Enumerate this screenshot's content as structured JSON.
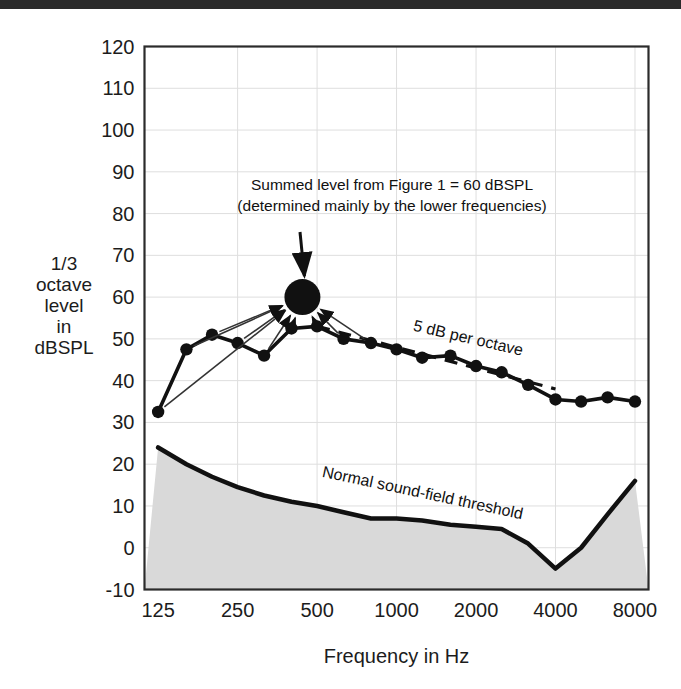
{
  "figure": {
    "background_color": "#ffffff",
    "top_rule_color": "#2b2b2b",
    "ylabel_lines": [
      "1/3",
      "octave",
      "level",
      "in",
      "dBSPL"
    ],
    "xlabel": "Frequency in Hz"
  },
  "chart_data": {
    "type": "line",
    "title": "",
    "xlabel": "Frequency in Hz",
    "ylabel": "1/3 octave level in dBSPL",
    "x_scale": "log",
    "xlim": [
      111,
      9000
    ],
    "ylim": [
      -10,
      120
    ],
    "ytick_labels": [
      "120",
      "110",
      "100",
      "90",
      "80",
      "70",
      "60",
      "50",
      "40",
      "30",
      "20",
      "10",
      "0",
      "-10"
    ],
    "yticks": [
      120,
      110,
      100,
      90,
      80,
      70,
      60,
      50,
      40,
      30,
      20,
      10,
      0,
      -10
    ],
    "xtick_labels": [
      "125",
      "250",
      "500",
      "1000",
      "2000",
      "4000",
      "8000"
    ],
    "xticks": [
      125,
      250,
      500,
      1000,
      2000,
      4000,
      8000
    ],
    "grid": true,
    "legend_position": "none",
    "series": [
      {
        "name": "1/3 octave band levels",
        "style": "line-markers",
        "color": "#111111",
        "marker": "filled-circle",
        "x": [
          125,
          160,
          200,
          250,
          315,
          400,
          500,
          630,
          800,
          1000,
          1250,
          1600,
          2000,
          2500,
          3150,
          4000,
          5000,
          6300,
          8000
        ],
        "values": [
          32.5,
          47.5,
          51.0,
          49.0,
          46.0,
          52.5,
          53.0,
          50.0,
          49.0,
          47.5,
          45.5,
          46.0,
          43.5,
          42.0,
          39.0,
          35.5,
          35.0,
          36.0,
          35.0
        ]
      },
      {
        "name": "5 dB per octave",
        "style": "dashed",
        "color": "#111111",
        "x": [
          500,
          4000
        ],
        "values": [
          53.0,
          38.0
        ]
      },
      {
        "name": "Normal sound-field threshold",
        "style": "filled-area",
        "color": "#111111",
        "fill": "#d9d9d9",
        "x": [
          125,
          160,
          200,
          250,
          315,
          400,
          500,
          630,
          800,
          1000,
          1250,
          1600,
          2000,
          2500,
          3150,
          4000,
          5000,
          6300,
          8000
        ],
        "values": [
          24.0,
          20.0,
          17.0,
          14.5,
          12.5,
          11.0,
          10.0,
          8.5,
          7.0,
          7.0,
          6.5,
          5.5,
          5.0,
          4.5,
          1.0,
          -5.0,
          0.0,
          8.0,
          16.0
        ]
      }
    ],
    "points": [
      {
        "name": "summed-level-marker",
        "x": 440,
        "y": 60,
        "marker": "large-filled-circle",
        "color": "#111111"
      }
    ],
    "annotations": [
      {
        "name": "summed-level-annotation",
        "lines": [
          "Summed level from Figure 1 = 60 dBSPL",
          "(determined mainly by the lower frequencies)"
        ],
        "x": 390,
        "y": 78,
        "has_arrow": true
      },
      {
        "name": "slope-annotation",
        "text": "5 dB per octave",
        "rotation_deg": 13,
        "x": 1150,
        "y": 52
      },
      {
        "name": "threshold-annotation",
        "text": "Normal sound-field threshold",
        "rotation_deg": 12,
        "x": 520,
        "y": 17
      }
    ]
  }
}
